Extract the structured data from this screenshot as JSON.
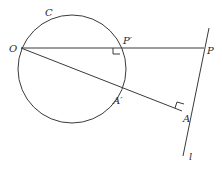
{
  "diagram": {
    "type": "geometry-inversion",
    "colors": {
      "stroke": "#3a3a3a",
      "text": "#2a2a2a",
      "background": "#ffffff"
    },
    "circle": {
      "label": "C",
      "cx": 72,
      "cy": 69,
      "r": 54
    },
    "points": {
      "O": {
        "label": "O",
        "x": 21,
        "y": 48
      },
      "P": {
        "label": "P",
        "x": 204,
        "y": 48
      },
      "P_prime": {
        "label": "P'",
        "x": 120,
        "y": 48
      },
      "A": {
        "label": "A",
        "x": 182,
        "y": 111
      },
      "A_prime": {
        "label": "A'",
        "x": 120,
        "y": 91
      }
    },
    "line_l": {
      "label": "l",
      "x1": 209,
      "y1": 28,
      "x2": 183,
      "y2": 156
    },
    "labels": {
      "C": "C",
      "O": "O",
      "P": "P",
      "P_prime": "P′",
      "A": "A",
      "A_prime": "A′",
      "l": "l"
    }
  }
}
